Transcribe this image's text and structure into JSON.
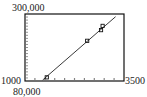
{
  "chart_data": {
    "type": "scatter",
    "title": "",
    "xlabel": "",
    "ylabel": "",
    "xlim": [
      1000,
      3500
    ],
    "ylim": [
      80000,
      300000
    ],
    "tick_labels": {
      "x_min": "1000",
      "x_max": "3500",
      "y_min": "80,000",
      "y_max": "300,000"
    },
    "x_ticks": [
      1250,
      1500,
      1750,
      2000,
      2250,
      2500,
      2750,
      3000,
      3250
    ],
    "y_ticks": [
      90000,
      100000,
      110000,
      120000,
      130000,
      140000,
      150000,
      160000,
      170000,
      180000,
      190000,
      200000,
      210000,
      220000,
      230000,
      240000,
      250000,
      260000,
      270000,
      280000,
      290000
    ],
    "series": [
      {
        "name": "data",
        "x": [
          1550,
          2570,
          2920,
          2960
        ],
        "y": [
          92000,
          212000,
          247000,
          261000
        ]
      }
    ],
    "line": {
      "name": "graph-line",
      "x": [
        1447,
        3287
      ],
      "y": [
        83300,
        291100
      ]
    },
    "grid": false,
    "legend": "none"
  }
}
